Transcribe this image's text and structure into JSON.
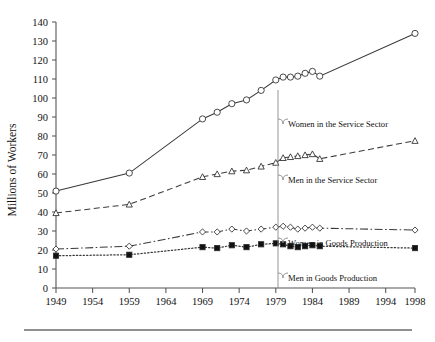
{
  "chart_data": {
    "type": "line",
    "title": "",
    "xlabel": "",
    "ylabel": "Millions of Workers",
    "xlim": [
      1949,
      1998
    ],
    "ylim": [
      0,
      140
    ],
    "ytick_step": 10,
    "grid": false,
    "legend_position": "inline-annotations",
    "xticks": [
      1949,
      1954,
      1959,
      1964,
      1969,
      1974,
      1979,
      1984,
      1989,
      1994,
      1998
    ],
    "ytick_labels": [
      "0",
      "10",
      "20",
      "30",
      "40",
      "50",
      "60",
      "70",
      "80",
      "90",
      "100",
      "110",
      "120",
      "130",
      "140"
    ],
    "series": [
      {
        "name": "Women in the Service Sector",
        "marker": "circle-open",
        "line_style": "solid",
        "x": [
          1949,
          1959,
          1969,
          1971,
          1973,
          1975,
          1977,
          1979,
          1980,
          1981,
          1982,
          1983,
          1984,
          1985,
          1998
        ],
        "values": [
          51,
          60.5,
          89,
          92.5,
          97,
          99,
          104,
          109.5,
          111,
          111,
          111.5,
          113,
          114,
          111.5,
          134
        ]
      },
      {
        "name": "Men in the Service Sector",
        "marker": "triangle-open",
        "line_style": "dashed",
        "x": [
          1949,
          1959,
          1969,
          1971,
          1973,
          1975,
          1977,
          1979,
          1980,
          1981,
          1982,
          1983,
          1984,
          1985,
          1998
        ],
        "values": [
          39.5,
          44,
          58.5,
          60,
          61.5,
          62,
          64,
          66,
          68.5,
          69,
          69.5,
          70,
          70.5,
          68,
          77.5
        ]
      },
      {
        "name": "Women in Goods Production",
        "marker": "diamond-open",
        "line_style": "dash-dot",
        "x": [
          1949,
          1959,
          1969,
          1971,
          1973,
          1975,
          1977,
          1979,
          1980,
          1981,
          1982,
          1983,
          1984,
          1985,
          1998
        ],
        "values": [
          20.5,
          22,
          29.5,
          29.5,
          31,
          30,
          31,
          32,
          32.5,
          32,
          31,
          31.5,
          32,
          31.5,
          30.5
        ]
      },
      {
        "name": "Men in Goods Production",
        "marker": "square-filled",
        "line_style": "dotted",
        "x": [
          1949,
          1959,
          1969,
          1971,
          1973,
          1975,
          1977,
          1979,
          1980,
          1981,
          1982,
          1983,
          1984,
          1985,
          1998
        ],
        "values": [
          17,
          17.5,
          21.5,
          21,
          22.5,
          21.5,
          23,
          23.5,
          23,
          22,
          21.5,
          22,
          22.5,
          22,
          21
        ]
      }
    ],
    "annotations": [
      {
        "label": "Women in the Service Sector",
        "x": 288,
        "y": 124
      },
      {
        "label": "Men in the Service Sector",
        "x": 288,
        "y": 180
      },
      {
        "label": "Women in Goods Production",
        "x": 288,
        "y": 243
      },
      {
        "label": "Men in Goods Production",
        "x": 288,
        "y": 278
      }
    ]
  },
  "colors": {
    "axis": "#555555",
    "series_stroke": "#3a3a3a",
    "marker_fill_open": "#ffffff",
    "marker_fill_solid": "#111111",
    "leader": "#8a8a8a",
    "background": "#ffffff",
    "rule": "#6b6b6b"
  }
}
